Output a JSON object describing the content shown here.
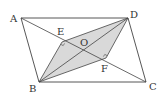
{
  "diagram": {
    "type": "parallelogram-geometry",
    "colors": {
      "stroke": "#444444",
      "shade": "#d9d9d9"
    },
    "points": {
      "A": {
        "label": "A",
        "x": 21,
        "y": 18
      },
      "B": {
        "label": "B",
        "x": 39,
        "y": 82
      },
      "C": {
        "label": "C",
        "x": 146,
        "y": 82
      },
      "D": {
        "label": "D",
        "x": 128,
        "y": 18
      },
      "E": {
        "label": "E",
        "x": 62,
        "y": 42
      },
      "F": {
        "label": "F",
        "x": 106,
        "y": 58
      },
      "O": {
        "label": "O",
        "x": 84,
        "y": 50
      }
    },
    "segments": [
      "AD",
      "DC",
      "CB",
      "BA",
      "AC",
      "BD",
      "BE",
      "ED",
      "DF",
      "FB"
    ],
    "shaded_region": "BEDF",
    "right_angles": [
      "E",
      "F"
    ]
  }
}
